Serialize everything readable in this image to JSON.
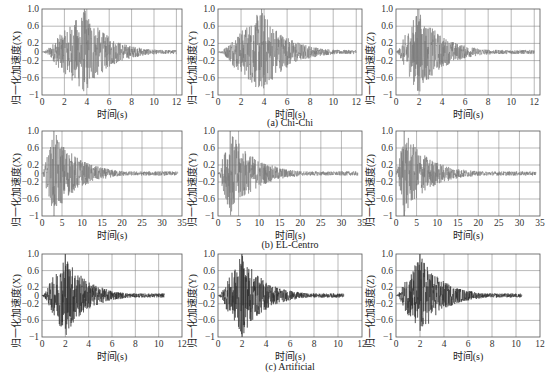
{
  "figure": {
    "captions": [
      "(a) Chi-Chi",
      "(b) EL-Centro",
      "(c) Artificial"
    ],
    "xlabel": "时间(s)",
    "ylabels": [
      "归一化加速度(X)",
      "归一化加速度(Y)",
      "归一化加速度(Z)"
    ]
  },
  "colors": {
    "grid": "#8a8a8a",
    "frame": "#555555",
    "trace_light": "#777777",
    "trace_dark": "#2a2a2a"
  },
  "chart_data": [
    {
      "type": "line",
      "title": "",
      "group": "(a) Chi-Chi",
      "series": [
        {
          "name": "X",
          "peak_t": 3.8,
          "peak_pos": 1.0,
          "peak_neg": -0.7,
          "end_t": 12
        }
      ],
      "xlabel": "时间(s)",
      "ylabel": "归一化加速度(X)",
      "xlim": [
        0,
        12.5
      ],
      "ylim": [
        -1,
        1
      ],
      "xticks": [
        0,
        2,
        4,
        6,
        8,
        10,
        12
      ],
      "yticks": [
        -1,
        -0.6,
        -0.2,
        0,
        0.2,
        0.6,
        1.0
      ],
      "grid": true
    },
    {
      "type": "line",
      "title": "",
      "group": "(a) Chi-Chi",
      "series": [
        {
          "name": "Y",
          "peak_t": 3.8,
          "peak_pos": 1.0,
          "peak_neg": -0.8,
          "end_t": 12
        }
      ],
      "xlabel": "时间(s)",
      "ylabel": "归一化加速度(Y)",
      "xlim": [
        0,
        12.5
      ],
      "ylim": [
        -1,
        1
      ],
      "xticks": [
        0,
        2,
        4,
        6,
        8,
        10,
        12
      ],
      "yticks": [
        -1,
        -0.6,
        -0.2,
        0,
        0.2,
        0.6,
        1.0
      ],
      "grid": true
    },
    {
      "type": "line",
      "title": "",
      "group": "(a) Chi-Chi",
      "series": [
        {
          "name": "Z",
          "peak_t": 1.9,
          "peak_pos": 1.0,
          "peak_neg": -0.9,
          "end_t": 12
        }
      ],
      "xlabel": "时间(s)",
      "ylabel": "归一化加速度(Z)",
      "xlim": [
        0,
        12.5
      ],
      "ylim": [
        -1,
        1
      ],
      "xticks": [
        0,
        2,
        4,
        6,
        8,
        10,
        12
      ],
      "yticks": [
        -1,
        -0.6,
        -0.2,
        0,
        0.2,
        0.6,
        1.0
      ],
      "grid": true
    },
    {
      "type": "line",
      "title": "",
      "group": "(b) EL-Centro",
      "series": [
        {
          "name": "X",
          "peak_t": 3.0,
          "peak_pos": 1.0,
          "peak_neg": -1.0,
          "end_t": 34
        }
      ],
      "xlabel": "时间(s)",
      "ylabel": "归一化加速度(X)",
      "xlim": [
        0,
        35
      ],
      "ylim": [
        -1,
        1
      ],
      "xticks": [
        0,
        5,
        10,
        15,
        20,
        25,
        30,
        35
      ],
      "yticks": [
        -1,
        -0.6,
        -0.2,
        0,
        0.2,
        0.6,
        1.0
      ],
      "grid": true
    },
    {
      "type": "line",
      "title": "",
      "group": "(b) EL-Centro",
      "series": [
        {
          "name": "Y",
          "peak_t": 3.0,
          "peak_pos": 1.0,
          "peak_neg": -0.8,
          "end_t": 34
        }
      ],
      "xlabel": "时间(s)",
      "ylabel": "归一化加速度(Y)",
      "xlim": [
        0,
        35
      ],
      "ylim": [
        -1,
        1
      ],
      "xticks": [
        0,
        5,
        10,
        15,
        20,
        25,
        30,
        35
      ],
      "yticks": [
        -1,
        -0.6,
        -0.2,
        0,
        0.2,
        0.6,
        1.0
      ],
      "grid": true
    },
    {
      "type": "line",
      "title": "",
      "group": "(b) EL-Centro",
      "series": [
        {
          "name": "Z",
          "peak_t": 2.0,
          "peak_pos": 1.0,
          "peak_neg": -1.0,
          "end_t": 34
        }
      ],
      "xlabel": "时间(s)",
      "ylabel": "归一化加速度(Z)",
      "xlim": [
        0,
        35
      ],
      "ylim": [
        -1,
        1
      ],
      "xticks": [
        0,
        5,
        10,
        15,
        20,
        25,
        30,
        35
      ],
      "yticks": [
        -1,
        -0.6,
        -0.2,
        0,
        0.2,
        0.6,
        1.0
      ],
      "grid": true
    },
    {
      "type": "line",
      "title": "",
      "group": "(c) Artificial",
      "series": [
        {
          "name": "X",
          "peak_t": 2.0,
          "peak_pos": 1.0,
          "peak_neg": -0.8,
          "end_t": 10.5
        }
      ],
      "xlabel": "时间(s)",
      "ylabel": "归一化加速度(X)",
      "xlim": [
        0,
        12
      ],
      "ylim": [
        -1,
        1
      ],
      "xticks": [
        0,
        2,
        4,
        6,
        8,
        10,
        12
      ],
      "yticks": [
        -1,
        -0.6,
        -0.2,
        0,
        0.2,
        0.6,
        1.0
      ],
      "grid": true
    },
    {
      "type": "line",
      "title": "",
      "group": "(c) Artificial",
      "series": [
        {
          "name": "Y",
          "peak_t": 2.0,
          "peak_pos": 1.0,
          "peak_neg": -1.0,
          "end_t": 10.5
        }
      ],
      "xlabel": "时间(s)",
      "ylabel": "归一化加速度(Y)",
      "xlim": [
        0,
        12
      ],
      "ylim": [
        -1,
        1
      ],
      "xticks": [
        0,
        2,
        4,
        6,
        8,
        10,
        12
      ],
      "yticks": [
        -1,
        -0.6,
        -0.2,
        0,
        0.2,
        0.6,
        1.0
      ],
      "grid": true
    },
    {
      "type": "line",
      "title": "",
      "group": "(c) Artificial",
      "series": [
        {
          "name": "Z",
          "peak_t": 2.0,
          "peak_pos": 1.0,
          "peak_neg": -0.85,
          "end_t": 10.5
        }
      ],
      "xlabel": "时间(s)",
      "ylabel": "归一化加速度(Z)",
      "xlim": [
        0,
        12
      ],
      "ylim": [
        -1,
        1
      ],
      "xticks": [
        0,
        2,
        4,
        6,
        8,
        10,
        12
      ],
      "yticks": [
        -1,
        -0.6,
        -0.2,
        0,
        0.2,
        0.6,
        1.0
      ],
      "grid": true
    }
  ]
}
